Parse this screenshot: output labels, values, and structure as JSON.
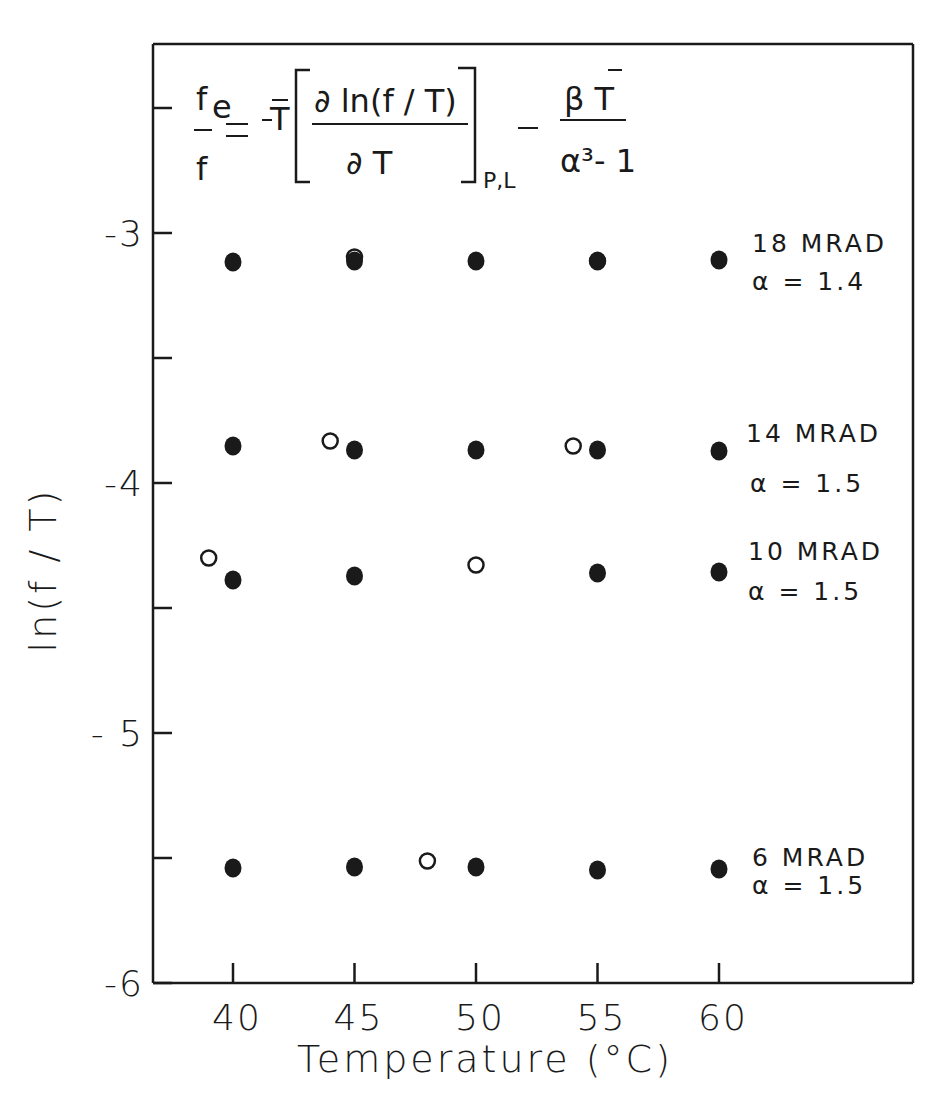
{
  "chart_data": {
    "type": "scatter",
    "title": "",
    "xlabel": "Temperature (°C)",
    "ylabel": "ln(f / T)",
    "xlim": [
      36.7,
      68.3
    ],
    "ylim": [
      -6.0,
      -2.26
    ],
    "grid": false,
    "x_ticks": [
      40,
      45,
      50,
      55,
      60
    ],
    "x_tick_labels": [
      "40",
      "45",
      "50",
      "55",
      "60"
    ],
    "y_ticks": [
      -3,
      -3.5,
      -4,
      -4.5,
      -5,
      -5.5,
      -6
    ],
    "y_tick_labels": [
      "-3",
      "",
      "-4",
      "",
      "- 5",
      "",
      "-6"
    ],
    "y_minor_ticks": [
      -2.5
    ],
    "annotation_equation": {
      "lhs_num": "f",
      "lhs_sub": "e",
      "lhs_den": "f",
      "equals": "=",
      "coef": "-T̄",
      "frac_num": "∂ ln(f / T)",
      "frac_den": "∂ T",
      "subscript": "P,L",
      "minus": "–",
      "frac2_num": "β T̄",
      "frac2_den": "α³- 1"
    },
    "marker_legend": {
      "filled": "filled circle",
      "open": "open circle",
      "concentric": "open circle with filled center"
    },
    "series": [
      {
        "name": "18 MRAD",
        "alpha_label": "α = 1.4",
        "filled": [
          [
            40,
            -3.116
          ],
          [
            45,
            -3.112
          ],
          [
            50,
            -3.112
          ],
          [
            55,
            -3.112
          ],
          [
            60,
            -3.108
          ]
        ],
        "open": [
          [
            45,
            -3.096
          ],
          [
            55,
            -3.112
          ]
        ]
      },
      {
        "name": "14 MRAD",
        "alpha_label": "α = 1.5",
        "filled": [
          [
            40,
            -3.852
          ],
          [
            45,
            -3.868
          ],
          [
            50,
            -3.868
          ],
          [
            55,
            -3.868
          ],
          [
            60,
            -3.872
          ]
        ],
        "open": [
          [
            44,
            -3.832
          ],
          [
            54,
            -3.852
          ]
        ]
      },
      {
        "name": "10 MRAD",
        "alpha_label": "α = 1.5",
        "filled": [
          [
            40,
            -4.388
          ],
          [
            45,
            -4.372
          ],
          [
            55,
            -4.36
          ],
          [
            60,
            -4.356
          ]
        ],
        "open": [
          [
            39,
            -4.3
          ],
          [
            50,
            -4.328
          ]
        ]
      },
      {
        "name": "6 MRAD",
        "alpha_label": "α = 1.5",
        "filled": [
          [
            40,
            -5.54
          ],
          [
            45,
            -5.536
          ],
          [
            50,
            -5.536
          ],
          [
            55,
            -5.548
          ],
          [
            60,
            -5.544
          ]
        ],
        "open": [
          [
            48,
            -5.512
          ]
        ]
      }
    ]
  },
  "labels": {
    "x_axis_title": "Temperature (°C)",
    "y_axis_title": "ln(f / T)",
    "series_18": "18 MRAD",
    "series_18_alpha": "α = 1.4",
    "series_14": "14 MRAD",
    "series_14_alpha": "α = 1.5",
    "series_10": "10 MRAD",
    "series_10_alpha": "α = 1.5",
    "series_6": "6 MRAD",
    "series_6_alpha": "α = 1.5"
  },
  "colors": {
    "ink": "#1a1a1a",
    "background": "#ffffff"
  }
}
